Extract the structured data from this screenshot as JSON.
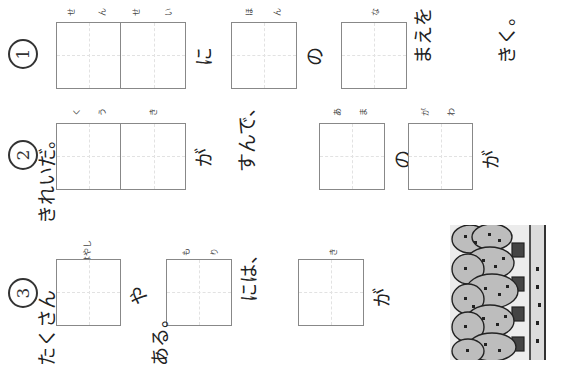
{
  "worksheet": {
    "orientation": "rotated 90deg counter-clockwise",
    "questions": [
      {
        "number": "①",
        "segments": [
          {
            "type": "box",
            "cells": 2,
            "furigana": [
              "せん",
              "せい"
            ]
          },
          {
            "type": "text",
            "value": "に"
          },
          {
            "type": "box",
            "cells": 1,
            "furigana": [
              "ほん"
            ]
          },
          {
            "type": "text",
            "value": "の"
          },
          {
            "type": "box",
            "cells": 1,
            "furigana": [
              "な"
            ]
          },
          {
            "type": "text",
            "value": "まえを"
          },
          {
            "type": "text",
            "value": "きく。"
          }
        ]
      },
      {
        "number": "②",
        "segments": [
          {
            "type": "box",
            "cells": 2,
            "furigana": [
              "くう",
              "き"
            ]
          },
          {
            "type": "text",
            "value": "が"
          },
          {
            "type": "text",
            "value": "すんで、"
          },
          {
            "type": "box",
            "cells": 1,
            "furigana": [
              "あま"
            ]
          },
          {
            "type": "text",
            "value": "の"
          },
          {
            "type": "box",
            "cells": 1,
            "furigana": [
              "がわ"
            ]
          },
          {
            "type": "text",
            "value": "が"
          },
          {
            "type": "text",
            "value": "きれいだ。"
          }
        ]
      },
      {
        "number": "③",
        "segments": [
          {
            "type": "box",
            "cells": 1,
            "furigana": [
              "はやし"
            ]
          },
          {
            "type": "text",
            "value": "や"
          },
          {
            "type": "box",
            "cells": 1,
            "furigana": [
              "もり"
            ]
          },
          {
            "type": "text",
            "value": "には、"
          },
          {
            "type": "box",
            "cells": 1,
            "furigana": [
              "き"
            ]
          },
          {
            "type": "text",
            "value": "が"
          },
          {
            "type": "text",
            "value": "たくさん"
          },
          {
            "type": "text",
            "value": "ある。"
          }
        ]
      }
    ],
    "illustration": {
      "description": "forest-trees-illustration"
    }
  },
  "labels": {
    "q1_num": "1",
    "q2_num": "2",
    "q3_num": "3",
    "q1_f1a": "せ",
    "q1_f1b": "ん",
    "q1_f1c": "せ",
    "q1_f1d": "い",
    "q1_t1": "に",
    "q1_f2a": "ほ",
    "q1_f2b": "ん",
    "q1_t2": "の",
    "q1_f3a": "な",
    "q1_t3": "まえを",
    "q1_t4": "きく。",
    "q2_f1a": "く",
    "q2_f1b": "う",
    "q2_f1c": "き",
    "q2_t1": "が",
    "q2_t2": "すんで、",
    "q2_f2a": "あ",
    "q2_f2b": "ま",
    "q2_t3": "の",
    "q2_f3a": "が",
    "q2_f3b": "わ",
    "q2_t4": "が",
    "q2_t5": "きれいだ。",
    "q3_f1": "はやし",
    "q3_t1": "や",
    "q3_f2a": "も",
    "q3_f2b": "り",
    "q3_t2": "には、",
    "q3_f3": "き",
    "q3_t3": "が",
    "q3_t4": "たくさん",
    "q3_t5": "ある。"
  }
}
